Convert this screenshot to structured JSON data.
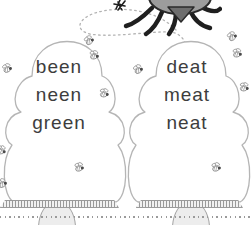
{
  "page": {
    "width": 251,
    "height": 225
  },
  "colors": {
    "background": "#ffffff",
    "word_ink": "#3d3d3d",
    "hive_outline": "#b5b5b5",
    "door_fill": "#ededed",
    "door_outline": "#a3a3a3",
    "base_fill": "#f1f1f1",
    "base_hatch": "#9a9a9a",
    "bee_outline": "#8f8f8f",
    "bee_head": "#4a4a4a",
    "bug_body": "#9c9c9c",
    "bug_shade": "#6e6e6e",
    "bug_legs": "#1f1f1f",
    "trail_dots": "#b3b3b3",
    "rule_dots": "#9a9a9a"
  },
  "hives": [
    {
      "name": "left-hive",
      "words": [
        "been",
        "neen",
        "green"
      ]
    },
    {
      "name": "right-hive",
      "words": [
        "deat",
        "meat",
        "neat"
      ]
    }
  ],
  "bees": [
    {
      "x": 83,
      "y": 35,
      "rot": -15
    },
    {
      "x": 88,
      "y": 50,
      "rot": 10
    },
    {
      "x": 1,
      "y": 63,
      "rot": -5
    },
    {
      "x": 98,
      "y": 88,
      "rot": 15
    },
    {
      "x": 132,
      "y": 64,
      "rot": -10
    },
    {
      "x": 226,
      "y": 31,
      "rot": -15
    },
    {
      "x": 231,
      "y": 48,
      "rot": 10
    },
    {
      "x": 238,
      "y": 82,
      "rot": 15
    },
    {
      "x": 73,
      "y": 162,
      "rot": 5
    },
    {
      "x": 210,
      "y": 162,
      "rot": 5
    },
    {
      "x": -5,
      "y": 145,
      "rot": 20
    },
    {
      "x": -4,
      "y": 178,
      "rot": -10
    }
  ],
  "illustrations": {
    "bug": "bug-top-partial",
    "trail": "dotted-flight-trail",
    "divider": "dotted-rule"
  }
}
